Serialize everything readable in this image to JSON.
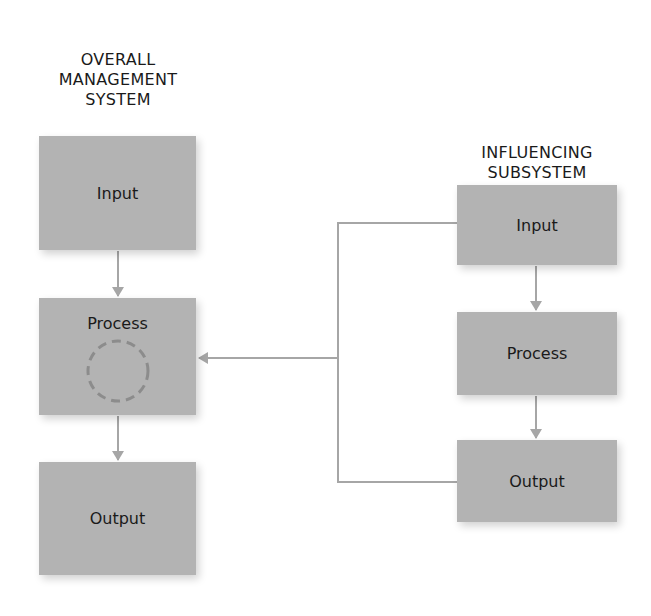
{
  "diagram": {
    "left_system": {
      "title": "OVERALL\nMANAGEMENT\nSYSTEM",
      "boxes": [
        {
          "label": "Input"
        },
        {
          "label": "Process"
        },
        {
          "label": "Output"
        }
      ]
    },
    "right_system": {
      "title": "INFLUENCING\nSUBSYSTEM",
      "boxes": [
        {
          "label": "Input"
        },
        {
          "label": "Process"
        },
        {
          "label": "Output"
        }
      ]
    },
    "colors": {
      "box_fill": "#b3b3b3",
      "arrow": "#a6a6a6",
      "text": "#1a1a1a"
    }
  }
}
